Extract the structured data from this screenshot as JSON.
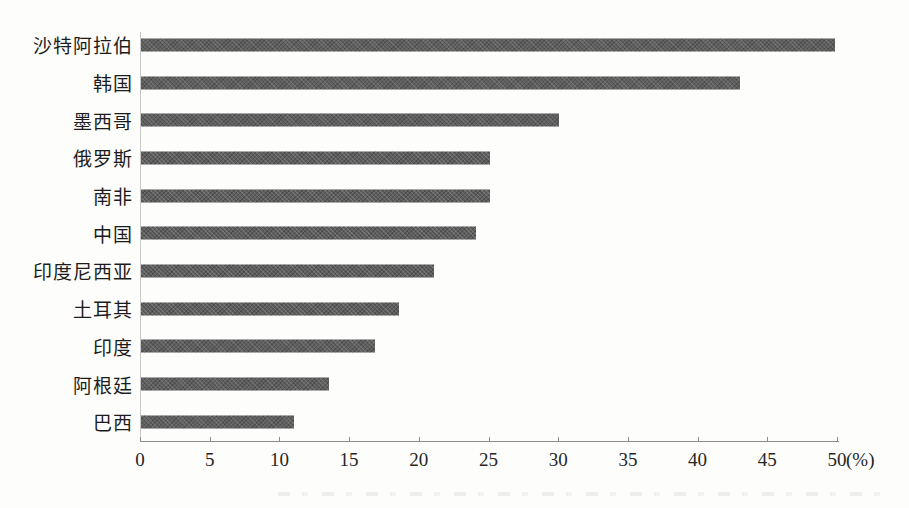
{
  "chart_data": {
    "type": "bar",
    "orientation": "horizontal",
    "title": "",
    "xlabel": "(%)",
    "ylabel": "",
    "categories": [
      "沙特阿拉伯",
      "韩国",
      "墨西哥",
      "俄罗斯",
      "南非",
      "中国",
      "印度尼西亚",
      "土耳其",
      "印度",
      "阿根廷",
      "巴西"
    ],
    "values": [
      49.8,
      43,
      30,
      25,
      25,
      24,
      21,
      18.5,
      16.8,
      13.5,
      11
    ],
    "xlim": [
      0,
      50
    ],
    "xticks": [
      0,
      5,
      10,
      15,
      20,
      25,
      30,
      35,
      40,
      45,
      50
    ],
    "grid": false,
    "legend": "none",
    "bar_color": "#5d5d5d",
    "axis_color": "#8c8c8c",
    "label_color": "#1c1c1c"
  }
}
